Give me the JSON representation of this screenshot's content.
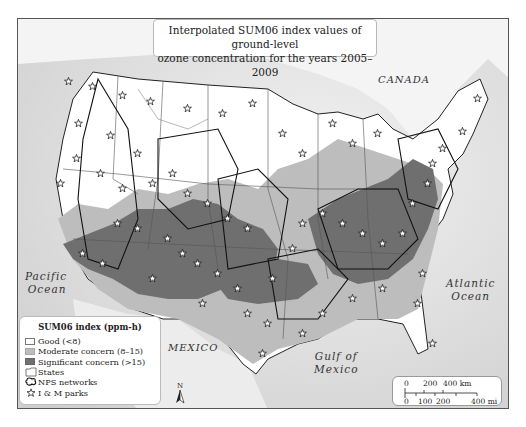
{
  "title": {
    "line1": "Interpolated SUM06 index values of ground-level",
    "line2": "ozone concentration for the years 2005–2009"
  },
  "labels": {
    "canada": "CANADA",
    "mexico": "MEXICO",
    "pacific_line1": "Pacific",
    "pacific_line2": "Ocean",
    "atlantic_line1": "Atlantic",
    "atlantic_line2": "Ocean",
    "gulf_line1": "Gulf of",
    "gulf_line2": "Mexico"
  },
  "legend": {
    "title": "SUM06 index (ppm-h)",
    "items": [
      {
        "label": "Good (<8)",
        "color": "#ffffff",
        "type": "swatch"
      },
      {
        "label": "Moderate concern (8–15)",
        "color": "#bdbdbd",
        "type": "swatch"
      },
      {
        "label": "Significant concern (>15)",
        "color": "#6f6f6f",
        "type": "swatch"
      },
      {
        "label": "States",
        "color": "#ffffff",
        "type": "states"
      },
      {
        "label": "NPS networks",
        "type": "networks"
      },
      {
        "label": "I & M parks",
        "type": "star"
      }
    ]
  },
  "scale": {
    "km_ticks": [
      "0",
      "200",
      "400 km"
    ],
    "mi_ticks": [
      "0",
      "100",
      "200",
      "400 mi"
    ]
  },
  "north_arrow": {
    "label": "N"
  },
  "colors": {
    "ocean": "#dcdcdc",
    "land_good": "#ffffff",
    "moderate": "#bdbdbd",
    "significant": "#6f6f6f",
    "border": "#222222"
  }
}
